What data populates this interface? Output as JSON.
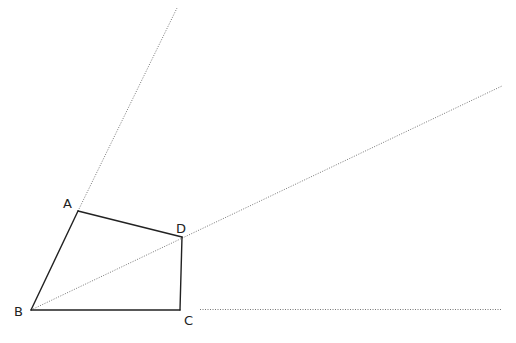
{
  "diagram": {
    "type": "geometry",
    "points": {
      "A": {
        "label": "A",
        "x": 78,
        "y": 211
      },
      "B": {
        "label": "B",
        "x": 31,
        "y": 310
      },
      "C": {
        "label": "C",
        "x": 180,
        "y": 310
      },
      "D": {
        "label": "D",
        "x": 182,
        "y": 237
      }
    },
    "segments": [
      {
        "from": "A",
        "to": "B",
        "style": "solid"
      },
      {
        "from": "B",
        "to": "C",
        "style": "solid"
      },
      {
        "from": "C",
        "to": "D",
        "style": "solid"
      },
      {
        "from": "D",
        "to": "A",
        "style": "solid"
      }
    ],
    "rays": [
      {
        "name": "ray-BA",
        "from": "B",
        "through": "A",
        "style": "dotted"
      },
      {
        "name": "ray-BD",
        "from": "B",
        "through": "D",
        "style": "dotted"
      },
      {
        "name": "ray-BC",
        "from": "C",
        "through": "beyond C",
        "style": "dotted"
      }
    ],
    "labels": {
      "A": "A",
      "B": "B",
      "C": "C",
      "D": "D"
    }
  }
}
